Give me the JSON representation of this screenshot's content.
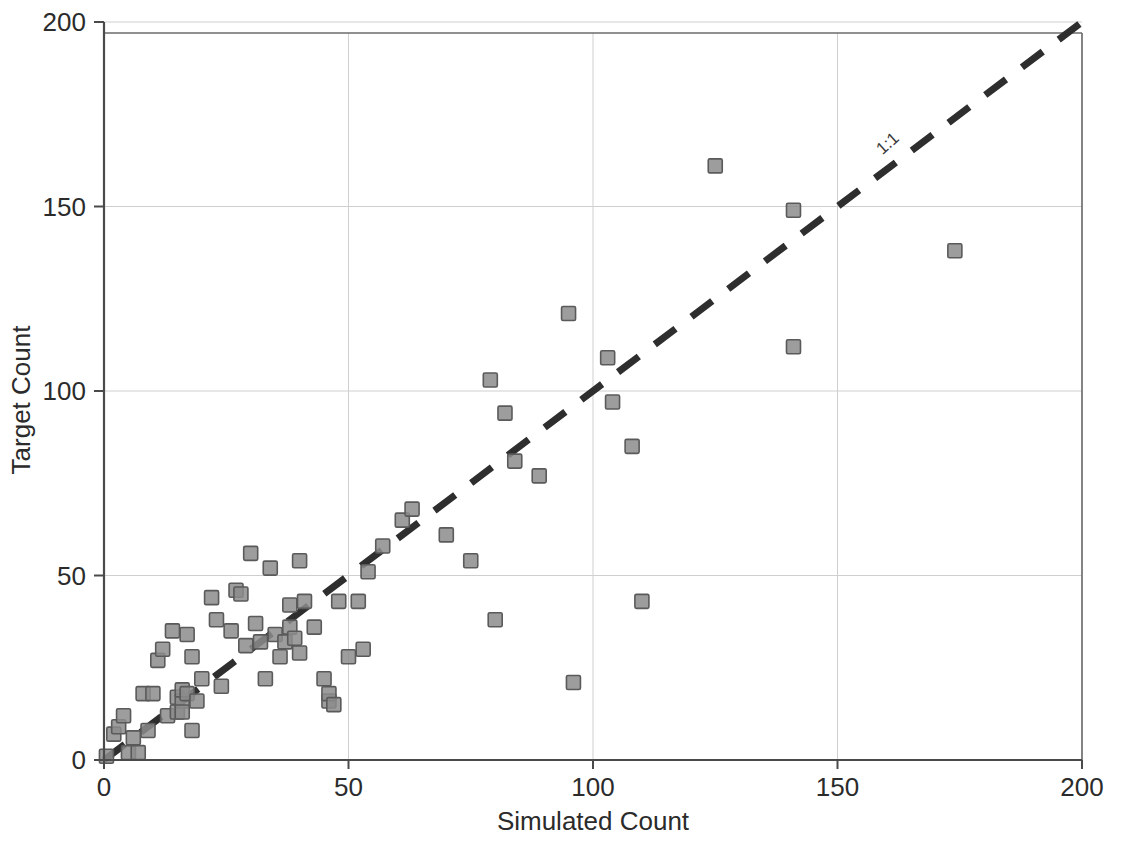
{
  "chart_data": {
    "type": "scatter",
    "title": "",
    "xlabel": "Simulated Count",
    "ylabel": "Target Count",
    "xlim": [
      0,
      200
    ],
    "ylim": [
      0,
      200
    ],
    "xticks": [
      0,
      50,
      100,
      150,
      200
    ],
    "yticks": [
      0,
      50,
      100,
      150,
      200
    ],
    "xtick_labels": [
      "0",
      "50",
      "100",
      "150",
      "200"
    ],
    "ytick_labels": [
      "0",
      "50",
      "100",
      "150",
      "200"
    ],
    "grid": true,
    "grid_color": "#cfcfcf",
    "legend": null,
    "marker": {
      "shape": "square",
      "size": 14,
      "fill": "#8c8c8c",
      "edge": "#5a5a5a"
    },
    "annotations": [
      {
        "text": "1:1",
        "x": 161,
        "y": 166,
        "rotation": -42
      }
    ],
    "reference_lines": [
      {
        "name": "one-to-one",
        "label": "1:1",
        "style": "dashed",
        "color": "#2e2e2e",
        "width": 7,
        "from": [
          0,
          0
        ],
        "to": [
          200,
          200
        ]
      }
    ],
    "series": [
      {
        "name": "counts",
        "points": [
          [
            0.5,
            1
          ],
          [
            2,
            7
          ],
          [
            3,
            9
          ],
          [
            4,
            12
          ],
          [
            5,
            2
          ],
          [
            6,
            6
          ],
          [
            7,
            2
          ],
          [
            8,
            18
          ],
          [
            9,
            8
          ],
          [
            10,
            18
          ],
          [
            11,
            27
          ],
          [
            12,
            30
          ],
          [
            13,
            12
          ],
          [
            14,
            35
          ],
          [
            15,
            13
          ],
          [
            15,
            17
          ],
          [
            16,
            16
          ],
          [
            16,
            19
          ],
          [
            16,
            13
          ],
          [
            17,
            34
          ],
          [
            17,
            18
          ],
          [
            18,
            28
          ],
          [
            18,
            8
          ],
          [
            19,
            16
          ],
          [
            20,
            22
          ],
          [
            22,
            44
          ],
          [
            23,
            38
          ],
          [
            24,
            20
          ],
          [
            26,
            35
          ],
          [
            27,
            46
          ],
          [
            28,
            45
          ],
          [
            29,
            31
          ],
          [
            30,
            56
          ],
          [
            31,
            37
          ],
          [
            32,
            32
          ],
          [
            33,
            22
          ],
          [
            34,
            52
          ],
          [
            35,
            34
          ],
          [
            36,
            28
          ],
          [
            37,
            32
          ],
          [
            38,
            42
          ],
          [
            38,
            36
          ],
          [
            39,
            33
          ],
          [
            40,
            29
          ],
          [
            40,
            54
          ],
          [
            41,
            43
          ],
          [
            43,
            36
          ],
          [
            45,
            22
          ],
          [
            46,
            16
          ],
          [
            46,
            18
          ],
          [
            47,
            15
          ],
          [
            48,
            43
          ],
          [
            50,
            28
          ],
          [
            52,
            43
          ],
          [
            53,
            30
          ],
          [
            54,
            51
          ],
          [
            57,
            58
          ],
          [
            61,
            65
          ],
          [
            63,
            68
          ],
          [
            70,
            61
          ],
          [
            75,
            54
          ],
          [
            79,
            103
          ],
          [
            80,
            38
          ],
          [
            82,
            94
          ],
          [
            84,
            81
          ],
          [
            89,
            77
          ],
          [
            95,
            121
          ],
          [
            96,
            21
          ],
          [
            103,
            109
          ],
          [
            104,
            97
          ],
          [
            108,
            85
          ],
          [
            110,
            43
          ],
          [
            125,
            161
          ],
          [
            141,
            149
          ],
          [
            141,
            112
          ],
          [
            174,
            138
          ]
        ]
      }
    ]
  },
  "axes": {
    "x_title": "Simulated Count",
    "y_title": "Target Count"
  }
}
